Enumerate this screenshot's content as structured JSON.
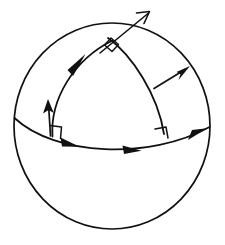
{
  "figure": {
    "title": "Spherical right triangle on a sphere",
    "type": "geometric-diagram",
    "domain": "spherical-geometry",
    "canvas": {
      "width": 225,
      "height": 245,
      "background": "#ffffff"
    },
    "style": {
      "ink_color": "#111111",
      "sphere_stroke_width": 1.7,
      "arc_stroke_width": 1.7,
      "vector_stroke_width": 1.8,
      "angle_mark_stroke_width": 1.5
    },
    "sphere": {
      "name": "sphere-outline",
      "shape": "circle",
      "center_x": 112,
      "center_y": 126,
      "radius_x": 98,
      "radius_y": 103,
      "filled": false
    },
    "vertices": [
      {
        "id": "apex",
        "label": "",
        "x": 110,
        "y": 42,
        "angle": "right",
        "marked": true
      },
      {
        "id": "base-left",
        "label": "",
        "x": 52,
        "y": 135,
        "angle": "right",
        "marked": true
      },
      {
        "id": "base-right",
        "label": "",
        "x": 163,
        "y": 133,
        "angle": "right",
        "marked": true
      }
    ],
    "arcs": [
      {
        "id": "left-meridian-arc",
        "description": "great-circle arc from base-left vertex up to apex, bulging left",
        "from": "base-left",
        "to": "apex",
        "curvature": "convex-left",
        "arrow_direction": "toward-apex"
      },
      {
        "id": "right-meridian-arc",
        "description": "great-circle arc from apex down to base-right vertex, bulging right",
        "from": "apex",
        "to": "base-right",
        "curvature": "convex-right",
        "arrow_direction": "none"
      },
      {
        "id": "equator-arc",
        "description": "base great-circle arc crossing the sphere, sagging downward",
        "from": "sphere-left-edge",
        "to": "sphere-right-edge",
        "curvature": "sag-down",
        "arrow_direction": "toward-right"
      }
    ],
    "arrows": [
      {
        "id": "apex-extension-arrow",
        "description": "long directed ray continuing the left arc through the apex and out past the sphere at upper right",
        "tip_x": 150,
        "tip_y": 11,
        "direction": "up-right",
        "style": "open-barbed"
      },
      {
        "id": "left-arc-direction-arrow",
        "description": "direction arrowhead on the left meridian arc",
        "tip_x": 84,
        "tip_y": 56,
        "direction": "up-right",
        "style": "open-barbed"
      },
      {
        "id": "base-left-tangent-vector",
        "description": "vertical tangent vector at the left base vertex pointing up",
        "tail_x": 50,
        "tail_y": 134,
        "tip_x": 48,
        "tip_y": 101,
        "direction": "up",
        "style": "solid-head"
      },
      {
        "id": "right-arc-normal-vector",
        "description": "vector emanating from the right meridian arc pointing up and to the right",
        "tail_x": 155,
        "tail_y": 86,
        "tip_x": 189,
        "tip_y": 67,
        "direction": "up-right",
        "style": "solid-head"
      },
      {
        "id": "equator-arrow-left",
        "description": "direction arrowhead on the base arc, left of center",
        "tip_x": 76,
        "tip_y": 145,
        "direction": "right",
        "style": "solid-head"
      },
      {
        "id": "equator-arrow-mid",
        "description": "direction arrowhead on the base arc, right of center",
        "tip_x": 138,
        "tip_y": 149,
        "direction": "right",
        "style": "solid-head"
      },
      {
        "id": "equator-arrow-right",
        "description": "direction arrowhead on the base arc near the right rim of the sphere",
        "tip_x": 205,
        "tip_y": 130,
        "direction": "up-right",
        "style": "solid-head"
      }
    ],
    "right_angle_marks": [
      {
        "id": "apex-right-angle",
        "at": "apex",
        "size": 11,
        "shape": "square",
        "rotated": true
      },
      {
        "id": "base-left-right-angle",
        "at": "base-left",
        "size": 10,
        "shape": "square",
        "rotated": false
      },
      {
        "id": "base-right-right-angle",
        "at": "base-right",
        "size": 10,
        "shape": "square",
        "rotated": false
      }
    ],
    "labels": []
  }
}
